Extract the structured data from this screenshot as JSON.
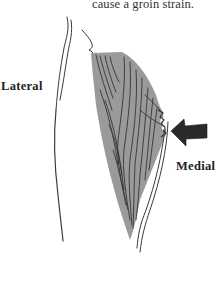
{
  "caption": {
    "text": "cause a groin strain."
  },
  "figure": {
    "labels": {
      "lateral": "Lateral",
      "medial": "Medial"
    },
    "arrow_direction": "left",
    "colors": {
      "muscle_fill": "#9a9a9a",
      "line": "#2b2b2b",
      "arrow": "#2a2a2a",
      "background": "#ffffff"
    }
  }
}
